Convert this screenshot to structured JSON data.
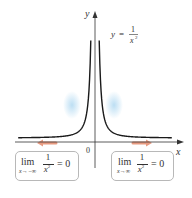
{
  "figure": {
    "function_label": {
      "lhs": "y",
      "equals": "=",
      "numerator": "1",
      "denominator": "x",
      "exponent": "2"
    },
    "axis_labels": {
      "x": "x",
      "y": "y",
      "origin": "0"
    },
    "left_limit": {
      "lim": "lim",
      "subscript": "x→−∞",
      "numerator": "1",
      "denominator": "x",
      "exponent": "2",
      "rhs": "= 0"
    },
    "right_limit": {
      "lim": "lim",
      "subscript": "x→∞",
      "numerator": "1",
      "denominator": "x",
      "exponent": "2",
      "rhs": "= 0"
    },
    "colors": {
      "curve": "#1a1a1a",
      "axis": "#333333",
      "arrow": "#e89a80",
      "glow": "#9fd0ee",
      "box_border": "#b8b8b8"
    }
  }
}
